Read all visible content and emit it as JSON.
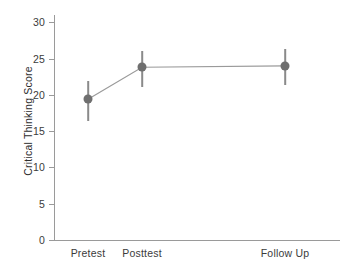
{
  "chart_data": {
    "type": "line",
    "title": "",
    "subtitle": "",
    "xlabel": "",
    "ylabel": "Critical Thinking Score",
    "categories": [
      "Pretest",
      "Posttest",
      "Follow Up"
    ],
    "values": [
      19.4,
      23.8,
      24.0
    ],
    "error_low": [
      16.4,
      21.1,
      21.4
    ],
    "error_high": [
      21.9,
      26.1,
      26.3
    ],
    "error_bars": "vertical lines, no caps",
    "ylim": [
      0,
      31
    ],
    "yticks": [
      0,
      5,
      10,
      15,
      20,
      25,
      30
    ],
    "ytick_labels": [
      "0",
      "5",
      "10",
      "15",
      "20",
      "25",
      "30"
    ],
    "xlim_categories_px": [
      88,
      142,
      285
    ],
    "grid": false,
    "legend": "none",
    "series": [
      {
        "name": "Critical Thinking Score",
        "values": [
          19.4,
          23.8,
          24.0
        ],
        "marker": "filled-circle",
        "marker_color": "#6f6f6f",
        "line_color": "#9a9a9a"
      }
    ],
    "colors": {
      "marker": "#6f6f6f",
      "line": "#9a9a9a",
      "errorbar": "#8a8a8a",
      "axis": "#9a9a9a",
      "text": "#3b3b3b",
      "background": "#ffffff"
    }
  }
}
